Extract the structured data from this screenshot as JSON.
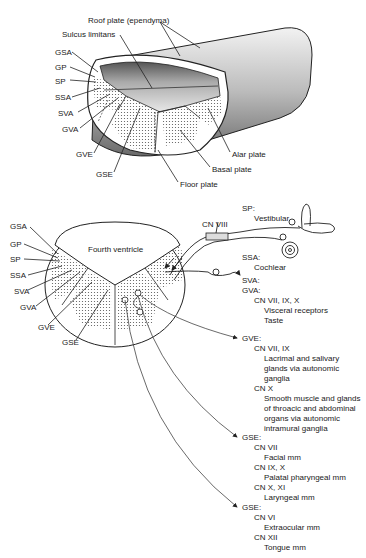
{
  "top_diagram": {
    "labels": {
      "roof_plate": "Roof plate (ependyma)",
      "sulcus_limitans": "Sulcus limitans",
      "gsa": "GSA",
      "gp": "GP",
      "sp": "SP",
      "ssa": "SSA",
      "sva": "SVA",
      "gva": "GVA",
      "gve": "GVE",
      "gse": "GSE",
      "alar_plate": "Alar plate",
      "basal_plate": "Basal plate",
      "floor_plate": "Floor plate"
    }
  },
  "bottom_diagram": {
    "labels": {
      "gsa": "GSA",
      "gp": "GP",
      "sp": "SP",
      "ssa": "SSA",
      "sva": "SVA",
      "gva": "GVA",
      "gve": "GVE",
      "gse": "GSE",
      "fourth_ventricle": "Fourth ventricle",
      "cn_viii": "CN VIII"
    },
    "sp_block": {
      "heading": "SP:",
      "item": "Vestibular"
    },
    "ssa_block": {
      "heading": "SSA:",
      "item": "Cochlear"
    },
    "sva_gva_block": {
      "heading1": "SVA:",
      "heading2": "GVA:",
      "nerve": "CN VII, IX, X",
      "items": [
        "Visceral receptors",
        "Taste"
      ]
    },
    "gve_block": {
      "heading": "GVE:",
      "nerve1": "CN VII, IX",
      "nerve1_lines": [
        "Lacrimal and salivary",
        "glands via autonomic",
        "ganglia"
      ],
      "nerve2": "CN X",
      "nerve2_lines": [
        "Smooth muscle and glands",
        "of throacic and abdominal",
        "organs via autonomic",
        "intramural ganglia"
      ]
    },
    "gse_block1": {
      "heading": "GSE:",
      "nerve1": "CN VII",
      "nerve1_item": "Facial mm",
      "nerve2": "CN IX, X",
      "nerve2_item": "Palatal pharyngeal mm",
      "nerve3": "CN X, XI",
      "nerve3_item": "Laryngeal mm"
    },
    "gse_block2": {
      "heading": "GSE:",
      "nerve1": "CN VI",
      "nerve1_item": "Extraocular mm",
      "nerve2": "CN XII",
      "nerve2_item": "Tongue mm"
    }
  }
}
